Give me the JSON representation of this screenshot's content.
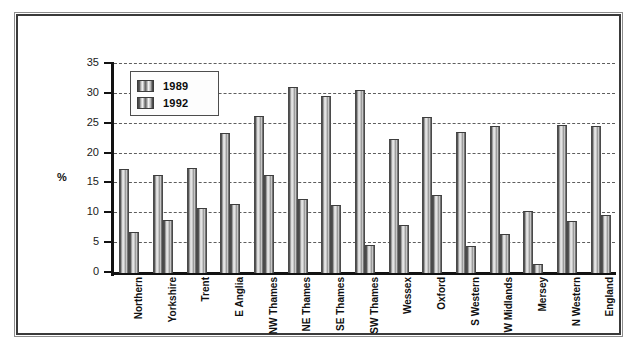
{
  "chart_data": {
    "type": "bar",
    "title": "",
    "xlabel": "",
    "ylabel": "%",
    "ylim": [
      0,
      35
    ],
    "yticks": [
      0,
      5,
      10,
      15,
      20,
      25,
      30,
      35
    ],
    "grid": true,
    "legend_position": "top-left-inside",
    "categories": [
      "Northern",
      "Yorkshire",
      "Trent",
      "E Anglia",
      "NW Thames",
      "NE Thames",
      "SE Thames",
      "SW Thames",
      "Wessex",
      "Oxford",
      "S Western",
      "W Midlands",
      "Mersey",
      "N Western",
      "England"
    ],
    "series": [
      {
        "name": "1989",
        "values": [
          17.3,
          16.2,
          17.5,
          23.3,
          26.2,
          31.0,
          29.4,
          30.4,
          22.2,
          26.0,
          23.5,
          24.5,
          10.2,
          24.6,
          24.4
        ]
      },
      {
        "name": "1992",
        "values": [
          6.7,
          8.7,
          10.7,
          11.4,
          16.2,
          12.2,
          11.2,
          4.6,
          7.8,
          12.9,
          4.4,
          6.4,
          1.3,
          8.6,
          9.5
        ]
      }
    ]
  },
  "colors": {
    "bar_dark": "#4a4a4a",
    "bar_light": "#efefef",
    "axis": "#121212",
    "grid": "#5e5e5e",
    "frame": "#3a3a3a",
    "background": "#ffffff"
  }
}
